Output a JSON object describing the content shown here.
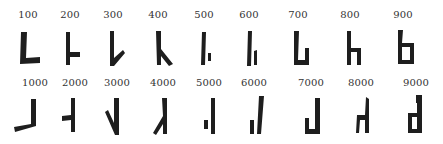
{
  "rows": [
    {
      "name": "hundreds",
      "labels": [
        "100",
        "200",
        "300",
        "400",
        "500",
        "600",
        "700",
        "800",
        "900"
      ]
    },
    {
      "name": "thousands",
      "labels": [
        "1000",
        "2000",
        "3000",
        "4000",
        "5000",
        "6000",
        "7000",
        "8000",
        "9000"
      ]
    }
  ],
  "colors": {
    "background": "#ffffff",
    "ink": "#1e1e1e",
    "label": "#333333"
  }
}
